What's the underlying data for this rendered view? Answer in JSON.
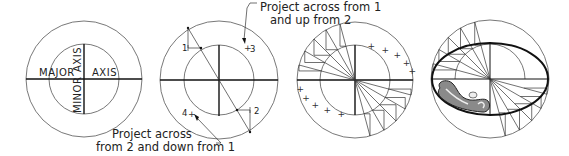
{
  "figure": {
    "panels": [
      {
        "id": "panel-1",
        "center": [
          84,
          79
        ],
        "outer_radius": 58,
        "inner_radius": 35,
        "labels": {
          "major_left": "MAJOR",
          "major_right": "AXIS",
          "minor_top": "AXIS",
          "minor_bottom": "MINOR"
        }
      },
      {
        "id": "panel-2",
        "center": [
          219,
          80
        ],
        "outer_radius": 59,
        "inner_radius": 35,
        "point_labels": [
          "1",
          "2",
          "3",
          "4"
        ],
        "annotation_top_line1": "Project across from 1",
        "annotation_top_line2": "and up from 2",
        "annotation_bottom_line1": "Project across",
        "annotation_bottom_line2": "from 2 and down from 1"
      },
      {
        "id": "panel-3",
        "center": [
          355,
          80
        ],
        "outer_radius": 58,
        "inner_radius": 35,
        "plus_marker": "+"
      },
      {
        "id": "panel-4",
        "center": [
          490,
          79
        ],
        "outer_radius": 59,
        "inner_radius": 35,
        "ellipse_rx": 58,
        "ellipse_ry": 36,
        "tool": "french-curve"
      }
    ]
  },
  "colors": {
    "line": "#333333",
    "axis": "#111111",
    "curve_fill": "#8a8a8a",
    "background": "#ffffff"
  }
}
